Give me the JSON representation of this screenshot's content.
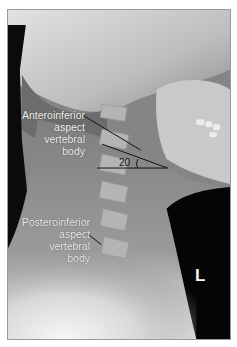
{
  "figure": {
    "type": "lateral cervical spine radiograph",
    "annotations": {
      "anteroinferior": {
        "lines": [
          "Anteroinferior",
          "aspect",
          "vertebral",
          "body"
        ]
      },
      "posteroinferior": {
        "lines": [
          "Posteroinferior",
          "aspect",
          "vertebral",
          "body"
        ]
      },
      "angle": "20"
    },
    "side_marker": "L",
    "colors": {
      "label_text": "#f2f2f2",
      "angle_lines": "#111111",
      "background_dark": "#050505"
    }
  }
}
